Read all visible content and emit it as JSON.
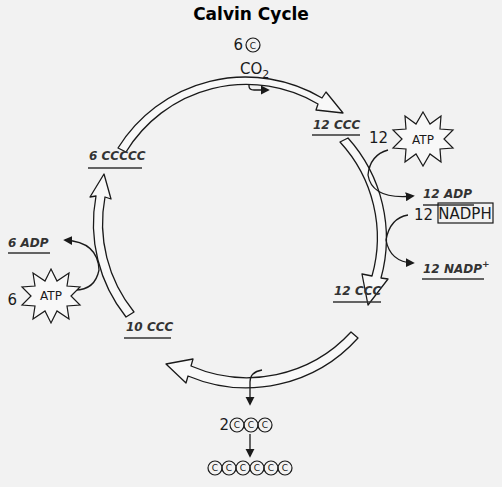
{
  "title": "Calvin Cycle",
  "input": {
    "count": "6",
    "carbon_symbol": "C",
    "molecule": "CO",
    "subscript": "2"
  },
  "nodes": {
    "top_right": "12 CCC",
    "right_bottom": "12 CCC",
    "bottom_left": "10 CCC",
    "left_top": "6 CCCCC"
  },
  "side_reactions": {
    "atp_right": {
      "count": "12",
      "label": "ATP",
      "product": "12 ADP"
    },
    "nadph": {
      "count": "12",
      "label": "NADPH",
      "product": "12 NADP",
      "product_sup": "+"
    },
    "atp_left": {
      "count": "6",
      "label": "ATP",
      "product": "6 ADP"
    }
  },
  "output": {
    "count": "2",
    "carbon_symbol": "C",
    "three_carbon_units": 3,
    "six_carbon_units": 6
  }
}
